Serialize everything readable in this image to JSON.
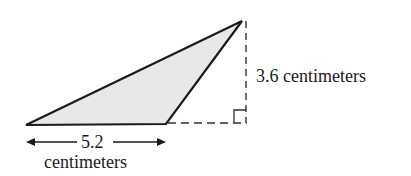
{
  "figure": {
    "type": "obtuse-triangle-area",
    "fill_color": "#e8e8e8",
    "stroke_color": "#1a1a1a",
    "base": {
      "value": "5.2",
      "unit": "centimeters"
    },
    "height": {
      "label": "3.6 centimeters"
    },
    "right_angle_marker": true
  }
}
